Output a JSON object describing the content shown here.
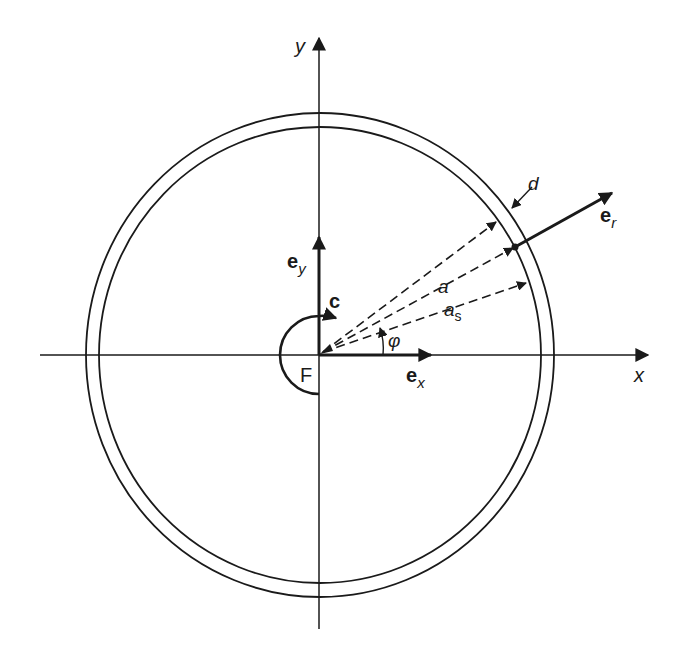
{
  "diagram": {
    "axes": {
      "x_label": "x",
      "y_label": "y"
    },
    "origin_label": "F",
    "rotation_label": "c",
    "unit_vectors": {
      "ex": {
        "base": "e",
        "sub": "x"
      },
      "ey": {
        "base": "e",
        "sub": "y"
      },
      "er": {
        "base": "e",
        "sub": "r"
      }
    },
    "radii": {
      "a": "a",
      "as_base": "a",
      "as_sub": "s"
    },
    "thickness_label": "d",
    "angle_label": "φ",
    "colors": {
      "stroke": "#1a1a1a",
      "background": "#ffffff"
    }
  }
}
